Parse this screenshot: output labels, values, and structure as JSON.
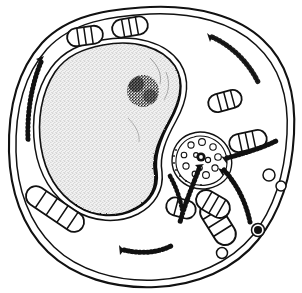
{
  "figure": {
    "title": "Animal cell ultrastructure line drawing",
    "caption": "",
    "width": 302,
    "height": 293,
    "background_color": "#ffffff",
    "ink_color": "#111111",
    "nucleus_fill_color": "#efefef",
    "stipple_color": "#9a9a9a",
    "style": "black and white pen-and-ink biological illustration"
  },
  "structures": {
    "plasma_membrane": {
      "label": "plasma membrane",
      "description": "irregular rounded double-line outer boundary of the cell",
      "outer_path": "M 150 7 C 196 5 238 16 263 40 C 288 63 296 98 294 134 C 292 172 282 210 258 240 C 234 270 196 285 156 287 C 114 289 74 277 48 252 C 22 227 10 190 9 152 C 8 112 16 72 42 43 C 68 15 108 9 150 7 Z",
      "inner_path": "M 150 14 C 194 12 233 23 256 45 C 280 67 289 99 287 134 C 285 170 276 206 253 235 C 230 263 194 278 156 280 C 116 282 78 270 54 247 C 29 223 17 188 16 152 C 15 114 23 76 47 49 C 72 22 110 16 150 14 Z",
      "stroke_width": 2
    },
    "nucleus": {
      "label": "nucleus",
      "description": "large kidney-bean shaped organelle filling the left half, filled with fine stipple, dark rough envelope on the lower-right concave side",
      "envelope_outer_path": "M 102 40 C 135 34 166 42 180 63 C 192 82 186 103 176 121 C 166 139 159 156 162 172 C 164 190 155 205 138 214 C 118 224 93 222 74 210 C 52 197 39 174 35 148 C 31 120 35 90 51 68 C 64 50 81 44 102 40 Z",
      "envelope_inner_path": "M 103 45 C 134 39 162 47 175 66 C 186 84 180 103 171 120 C 161 138 154 156 157 172 C 159 188 151 201 136 209 C 117 219 94 217 77 206 C 57 193 45 172 41 147 C 37 121 41 93 55 72 C 67 55 83 49 103 45 Z",
      "fill": "#efefef"
    },
    "nucleolus": {
      "label": "nucleolus",
      "description": "dense dark stippled round mass in the upper right portion of the nucleus",
      "cx": 143,
      "cy": 91,
      "r": 16
    },
    "golgi_centriole": {
      "label": "golgi apparatus / centrosome region",
      "description": "round cluster of small open vesicles around a dark ringed center, located right of the nucleus",
      "cx": 200,
      "cy": 157,
      "r": 25,
      "center_dot_r": 4,
      "vesicle_count": 12
    },
    "mitochondria": {
      "label": "mitochondria",
      "description": "capsule-shaped organelles with internal cristae cross-lines",
      "count": 8,
      "items": [
        {
          "name": "mitochondrion-top-left",
          "cx": 85,
          "cy": 36,
          "rx": 18,
          "ry": 9,
          "rot": -8,
          "cristae": 3
        },
        {
          "name": "mitochondrion-top-right",
          "cx": 130,
          "cy": 27,
          "rx": 18,
          "ry": 9,
          "rot": -10,
          "cristae": 3
        },
        {
          "name": "mitochondrion-right-upper",
          "cx": 225,
          "cy": 101,
          "rx": 17,
          "ry": 9,
          "rot": -15,
          "cristae": 3
        },
        {
          "name": "mitochondrion-right-lower",
          "cx": 248,
          "cy": 141,
          "rx": 19,
          "ry": 9,
          "rot": -12,
          "cristae": 3
        },
        {
          "name": "mitochondrion-left-long",
          "cx": 55,
          "cy": 209,
          "rx": 33,
          "ry": 10,
          "rot": 34,
          "cristae": 4
        },
        {
          "name": "mitochondrion-bottom-left",
          "cx": 181,
          "cy": 208,
          "rx": 15,
          "ry": 9,
          "rot": 15,
          "cristae": 3
        },
        {
          "name": "mitochondrion-bottom-mid",
          "cx": 215,
          "cy": 222,
          "rx": 24,
          "ry": 11,
          "rot": 58,
          "cristae": 4
        },
        {
          "name": "mitochondrion-bottom-right",
          "cx": 213,
          "cy": 205,
          "rx": 18,
          "ry": 10,
          "rot": 30,
          "cristae": 3
        }
      ]
    },
    "rough_er": {
      "label": "rough endoplasmic reticulum",
      "description": "curved arc strands studded with ribosome dots along one side, some with a flared arrow-like end",
      "count": 7,
      "items": [
        {
          "name": "er-strand-top-right",
          "path": "M 212 37 C 232 46 248 62 258 82",
          "dot_side": 1
        },
        {
          "name": "er-strand-left",
          "path": "M 41 62 C 31 86 27 114 28 140",
          "dot_side": 1
        },
        {
          "name": "er-strand-right-mid",
          "path": "M 227 158 C 245 153 262 148 276 141",
          "dot_side": 1
        },
        {
          "name": "er-strand-right-lower",
          "path": "M 224 170 C 238 185 246 203 250 222",
          "dot_side": -1
        },
        {
          "name": "er-strand-center-lower",
          "path": "M 199 169 C 192 186 185 203 180 221",
          "dot_side": -1
        },
        {
          "name": "er-strand-bottom",
          "path": "M 124 250 C 140 253 156 252 170 246",
          "dot_side": -1
        },
        {
          "name": "er-strand-bottom-left",
          "path": "M 170 176 C 176 186 180 197 182 208",
          "dot_side": 1
        }
      ]
    },
    "vesicles": {
      "label": "vesicles and lysosome",
      "description": "small open circles in the cytoplasm plus one dark filled lysosome on the right",
      "items": [
        {
          "name": "vesicle-right-upper",
          "cx": 269,
          "cy": 175,
          "r": 6,
          "filled": false
        },
        {
          "name": "vesicle-right-lower",
          "cx": 281,
          "cy": 186,
          "r": 5,
          "filled": false
        },
        {
          "name": "lysosome-right",
          "cx": 258,
          "cy": 230,
          "r": 6.5,
          "filled": true
        },
        {
          "name": "vesicle-bottom",
          "cx": 222,
          "cy": 253,
          "r": 5.5,
          "filled": false
        }
      ]
    }
  }
}
